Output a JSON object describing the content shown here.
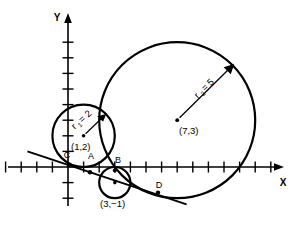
{
  "figure": {
    "title": "",
    "axes": {
      "x_label": "X",
      "y_label": "Y",
      "origin_px": [
        68,
        167
      ],
      "unit_px": 15.6,
      "x_ticks": [
        -4,
        -3,
        -2,
        -1,
        1,
        2,
        3,
        4,
        5,
        6,
        7,
        8,
        9,
        10,
        11,
        12,
        13
      ],
      "y_ticks": [
        -2,
        -1,
        1,
        2,
        3,
        4,
        5,
        6,
        7,
        8
      ],
      "tick_labels_shown": false,
      "grid": false
    },
    "circles": [
      {
        "name": "circle-1",
        "center_label": "(1,2)",
        "center": [
          1,
          2
        ],
        "radius": 2,
        "radius_label": "r",
        "radius_subscript": "1",
        "radius_value_label": "= 2",
        "radius_full_label": "r1 = 2"
      },
      {
        "name": "circle-2",
        "center_label": "(7,3)",
        "center": [
          7,
          3
        ],
        "radius": 5,
        "radius_label": "r",
        "radius_subscript": "2",
        "radius_value_label": "= 5",
        "radius_full_label": "r2 = 5"
      },
      {
        "name": "circle-3",
        "center_label": "(3,−1)",
        "center": [
          3,
          -1
        ],
        "radius": 1,
        "radius_label": "",
        "radius_subscript": "",
        "radius_value_label": "",
        "radius_full_label": ""
      }
    ],
    "points": [
      {
        "name": "point-c",
        "label": "C",
        "xy": [
          0.1,
          0.0
        ]
      },
      {
        "name": "point-a",
        "label": "A",
        "xy": [
          1.4,
          -0.25
        ]
      },
      {
        "name": "point-b",
        "label": "B",
        "xy": [
          3.0,
          0.05
        ]
      },
      {
        "name": "point-d",
        "label": "D",
        "xy": [
          5.8,
          -1.35
        ]
      }
    ],
    "tangent_line": {
      "name": "tangent-line",
      "from": [
        -2.6,
        1.0
      ],
      "to": [
        7.6,
        -2.4
      ]
    },
    "colors": {
      "stroke": "#000000",
      "background": "#ffffff"
    }
  }
}
